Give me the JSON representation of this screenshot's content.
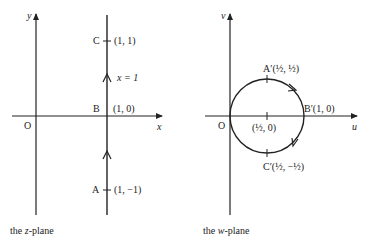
{
  "z_plane": {
    "caption_prefix": "the ",
    "caption_var": "z",
    "caption_suffix": "-plane",
    "x_axis_label": "x",
    "y_axis_label": "y",
    "origin_label": "O",
    "line_label": "x = 1",
    "points": [
      {
        "name": "C",
        "coord": "(1, 1)"
      },
      {
        "name": "B",
        "coord": "(1, 0)"
      },
      {
        "name": "A",
        "coord": "(1, −1)"
      }
    ]
  },
  "w_plane": {
    "caption_prefix": "the ",
    "caption_var": "w",
    "caption_suffix": "-plane",
    "u_axis_label": "u",
    "v_axis_label": "v",
    "origin_label": "O",
    "center_label": "(½, 0)",
    "points": [
      {
        "name": "A′",
        "coord": "(½, ½)"
      },
      {
        "name": "B′",
        "coord": "(1, 0)"
      },
      {
        "name": "C′",
        "coord": "(½, −½)"
      }
    ]
  },
  "colors": {
    "ink": "#222222",
    "background": "#ffffff"
  }
}
